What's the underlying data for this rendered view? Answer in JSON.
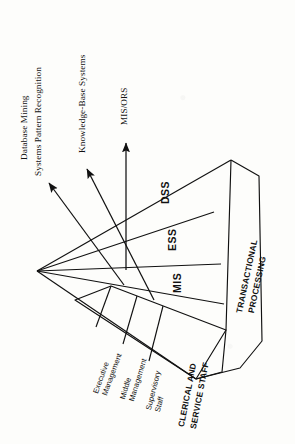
{
  "figure": {
    "orientation": "rotated-90-clockwise",
    "background_color": "#fdfdfb",
    "ink_color": "#111111",
    "type": "pyramid-hierarchy-diagram"
  },
  "callouts": [
    {
      "id": "callout-data-mining",
      "line1": "Database Mining",
      "line2": "Systems Pattern Recognition",
      "arrow": "arrow-to-dss"
    },
    {
      "id": "callout-knowledge-base",
      "line1": "Knowledge-Base Systems",
      "line2": "",
      "arrow": "arrow-to-ess"
    },
    {
      "id": "callout-mis-ors",
      "line1": "MIS/ORS",
      "line2": "",
      "arrow": "arrow-to-mis"
    }
  ],
  "pyramid": {
    "system_tiers": [
      {
        "id": "tier-dss",
        "acronym": "DSS"
      },
      {
        "id": "tier-ess",
        "acronym": "ESS"
      },
      {
        "id": "tier-mis",
        "acronym": "MIS"
      }
    ],
    "staff_tiers": [
      {
        "id": "tier-executive-management",
        "line1": "Executive",
        "line2": "Management",
        "bold": false
      },
      {
        "id": "tier-middle-management",
        "line1": "Middle",
        "line2": "Management",
        "bold": false
      },
      {
        "id": "tier-supervisory-staff",
        "line1": "Supervisory",
        "line2": "Staff",
        "bold": false
      },
      {
        "id": "tier-clerical-service-staff",
        "line1": "CLERICAL AND",
        "line2": "SERVICE STAFF",
        "bold": true
      }
    ],
    "base_block": {
      "id": "block-transactional-processing",
      "line1": "TRANSACTIONAL",
      "line2": "PROCESSING",
      "bold": true
    }
  }
}
